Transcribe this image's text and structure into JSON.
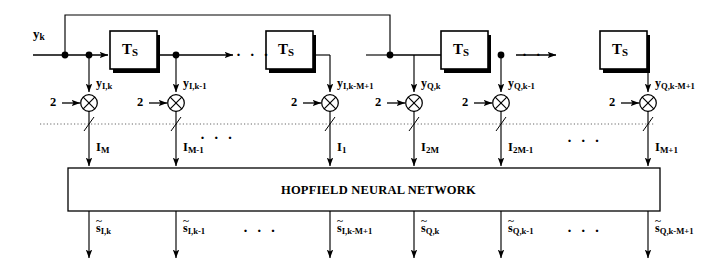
{
  "diagram": {
    "title_text": "HOPFIELD NEURAL NETWORK",
    "input_label": "y",
    "input_sub": "k",
    "delay_label": "T",
    "delay_sub": "S",
    "gain_value": "2",
    "ellipsis": "· · ·",
    "colors": {
      "line": "#000000",
      "box_fill": "#ffffff",
      "box_stroke": "#000000",
      "shadow": "#000000",
      "dotted_separator": "#555555",
      "background": "#ffffff"
    },
    "delay_blocks": [
      {
        "name": "delay-1",
        "label": "T",
        "sub": "S"
      },
      {
        "name": "delay-2",
        "label": "T",
        "sub": "S"
      },
      {
        "name": "delay-3",
        "label": "T",
        "sub": "S"
      },
      {
        "name": "delay-4",
        "label": "T",
        "sub": "S"
      }
    ],
    "gains": [
      {
        "name": "gain-1",
        "value": "2"
      },
      {
        "name": "gain-2",
        "value": "2"
      },
      {
        "name": "gain-3",
        "value": "2"
      },
      {
        "name": "gain-4",
        "value": "2"
      },
      {
        "name": "gain-5",
        "value": "2"
      },
      {
        "name": "gain-6",
        "value": "2"
      }
    ],
    "tap_signals": [
      {
        "base": "y",
        "sub": "I,k"
      },
      {
        "base": "y",
        "sub": "I,k-1"
      },
      {
        "base": "y",
        "sub": "I,k-M+1"
      },
      {
        "base": "y",
        "sub": "Q,k"
      },
      {
        "base": "y",
        "sub": "Q,k-1"
      },
      {
        "base": "y",
        "sub": "Q,k-M+1"
      }
    ],
    "currents": [
      {
        "base": "I",
        "sub": "M"
      },
      {
        "base": "I",
        "sub": "M-1"
      },
      {
        "base": "I",
        "sub": "1"
      },
      {
        "base": "I",
        "sub": "2M"
      },
      {
        "base": "I",
        "sub": "2M-1"
      },
      {
        "base": "I",
        "sub": "M+1"
      }
    ],
    "outputs": [
      {
        "base": "s",
        "sub": "I,k"
      },
      {
        "base": "s",
        "sub": "I,k-1"
      },
      {
        "base": "s",
        "sub": "I,k-M+1"
      },
      {
        "base": "s",
        "sub": "Q,k"
      },
      {
        "base": "s",
        "sub": "Q,k-1"
      },
      {
        "base": "s",
        "sub": "Q,k-M+1"
      }
    ],
    "ellipses": [
      {
        "name": "ellipsis-delay-row-i"
      },
      {
        "name": "ellipsis-delay-row-q"
      },
      {
        "name": "ellipsis-current-row-i"
      },
      {
        "name": "ellipsis-current-row-q"
      },
      {
        "name": "ellipsis-output-row-i"
      },
      {
        "name": "ellipsis-output-row-q"
      }
    ]
  }
}
